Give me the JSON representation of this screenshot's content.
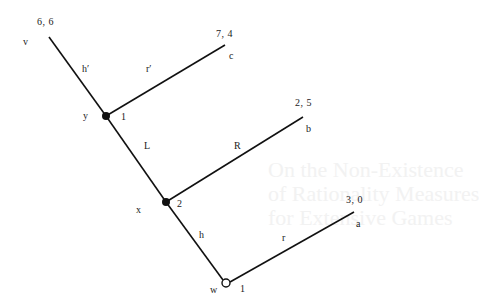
{
  "background_text": {
    "lines": [
      "On the Non-Existence",
      "of Rationality Measures",
      "for Extensive Games"
    ]
  },
  "tree": {
    "nodes": [
      {
        "id": "w",
        "player": "1",
        "type": "root",
        "style": "open"
      },
      {
        "id": "x",
        "player": "2",
        "type": "decision",
        "style": "filled"
      },
      {
        "id": "y",
        "player": "1",
        "type": "decision",
        "style": "filled"
      }
    ],
    "edges": [
      {
        "from": "w",
        "to": "x",
        "label": "h"
      },
      {
        "from": "w",
        "to": "a",
        "label": "r"
      },
      {
        "from": "x",
        "to": "y",
        "label": "L"
      },
      {
        "from": "x",
        "to": "b",
        "label": "R"
      },
      {
        "from": "y",
        "to": "v",
        "label": "h′"
      },
      {
        "from": "y",
        "to": "c",
        "label": "r′"
      }
    ],
    "terminals": [
      {
        "id": "v",
        "payoff": "6, 6"
      },
      {
        "id": "c",
        "payoff": "7, 4"
      },
      {
        "id": "b",
        "payoff": "2, 5"
      },
      {
        "id": "a",
        "payoff": "3, 0"
      }
    ]
  },
  "labels": {
    "node_w": "w",
    "node_w_player": "1",
    "node_x": "x",
    "node_x_player": "2",
    "node_y": "y",
    "node_y_player": "1",
    "term_v": "v",
    "term_c": "c",
    "term_b": "b",
    "term_a": "a",
    "pay_v": "6, 6",
    "pay_c": "7, 4",
    "pay_b": "2, 5",
    "pay_a": "3, 0",
    "edge_h_prime": "h′",
    "edge_r_prime": "r′",
    "edge_L": "L",
    "edge_R": "R",
    "edge_h": "h",
    "edge_r": "r"
  }
}
